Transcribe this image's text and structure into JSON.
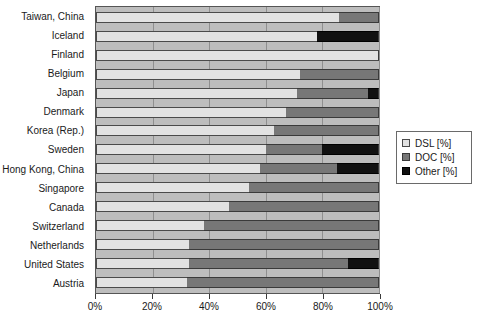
{
  "chart_data": {
    "type": "bar",
    "orientation": "horizontal",
    "stacked": true,
    "title": "",
    "xlabel": "",
    "ylabel": "",
    "xlim": [
      0,
      100
    ],
    "xticks": [
      0,
      20,
      40,
      60,
      80,
      100
    ],
    "xtick_labels": [
      "0%",
      "20%",
      "40%",
      "60%",
      "80%",
      "100%"
    ],
    "grid": true,
    "legend_position": "right",
    "categories": [
      "Taiwan, China",
      "Iceland",
      "Finland",
      "Belgium",
      "Japan",
      "Denmark",
      "Korea (Rep.)",
      "Sweden",
      "Hong Kong, China",
      "Singapore",
      "Canada",
      "Switzerland",
      "Netherlands",
      "United States",
      "Austria"
    ],
    "series": [
      {
        "name": "DSL [%]",
        "color": "#e2e2e2",
        "values": [
          86,
          78,
          100,
          72,
          71,
          67,
          63,
          60,
          58,
          54,
          47,
          38,
          33,
          33,
          32
        ]
      },
      {
        "name": "DOC [%]",
        "color": "#777777",
        "values": [
          14,
          0,
          0,
          28,
          25,
          33,
          37,
          20,
          27,
          46,
          53,
          62,
          67,
          56,
          68
        ]
      },
      {
        "name": "Other  [%]",
        "color": "#111111",
        "values": [
          0,
          22,
          0,
          0,
          4,
          0,
          0,
          20,
          15,
          0,
          0,
          0,
          0,
          11,
          0
        ]
      }
    ]
  },
  "legend": {
    "items": [
      {
        "label": "DSL [%]",
        "swatch": "dsl"
      },
      {
        "label": "DOC [%]",
        "swatch": "doc"
      },
      {
        "label": "Other  [%]",
        "swatch": "other"
      }
    ]
  },
  "colors": {
    "dsl": "#e2e2e2",
    "doc": "#777777",
    "other": "#111111",
    "plot_background": "#bdbdbd",
    "gridline": "#8f8f8f",
    "text": "#1a1a1a"
  }
}
